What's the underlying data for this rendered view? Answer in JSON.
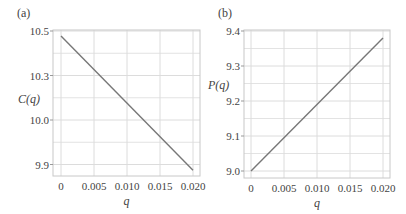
{
  "chart_data": [
    {
      "panel": "(a)",
      "type": "line",
      "title": "",
      "xlabel": "q",
      "ylabel": "C(q)",
      "x_ticks": [
        "0",
        "0.005",
        "0.010",
        "0.015",
        "0.020"
      ],
      "x_tick_values": [
        0,
        0.005,
        0.01,
        0.015,
        0.02
      ],
      "y_ticks": [
        "10.5",
        "10.3",
        "10.0",
        "9.9"
      ],
      "xlim": [
        0,
        0.02
      ],
      "grid": true,
      "series": [
        {
          "name": "C(q)",
          "color": "#777777",
          "x": [
            0,
            0.02
          ],
          "y_tick_fraction": [
            0.11,
            3.13
          ],
          "y": [
            10.47,
            9.87
          ]
        }
      ]
    },
    {
      "panel": "(b)",
      "type": "line",
      "title": "",
      "xlabel": "q",
      "ylabel": "P(q)",
      "x_ticks": [
        "0",
        "0.005",
        "0.010",
        "0.015",
        "0.020"
      ],
      "x_tick_values": [
        0,
        0.005,
        0.01,
        0.015,
        0.02
      ],
      "y_ticks": [
        "9.4",
        "9.3",
        "9.2",
        "9.1",
        "9.0"
      ],
      "xlim": [
        0,
        0.02
      ],
      "ylim": [
        9.0,
        9.4
      ],
      "grid": true,
      "series": [
        {
          "name": "P(q)",
          "color": "#777777",
          "x": [
            0,
            0.02
          ],
          "y": [
            9.0,
            9.38
          ]
        }
      ]
    }
  ],
  "colors": {
    "grid": "#dcdcdc",
    "frame": "#c8c8c8",
    "line": "#777777",
    "text": "#444444"
  }
}
